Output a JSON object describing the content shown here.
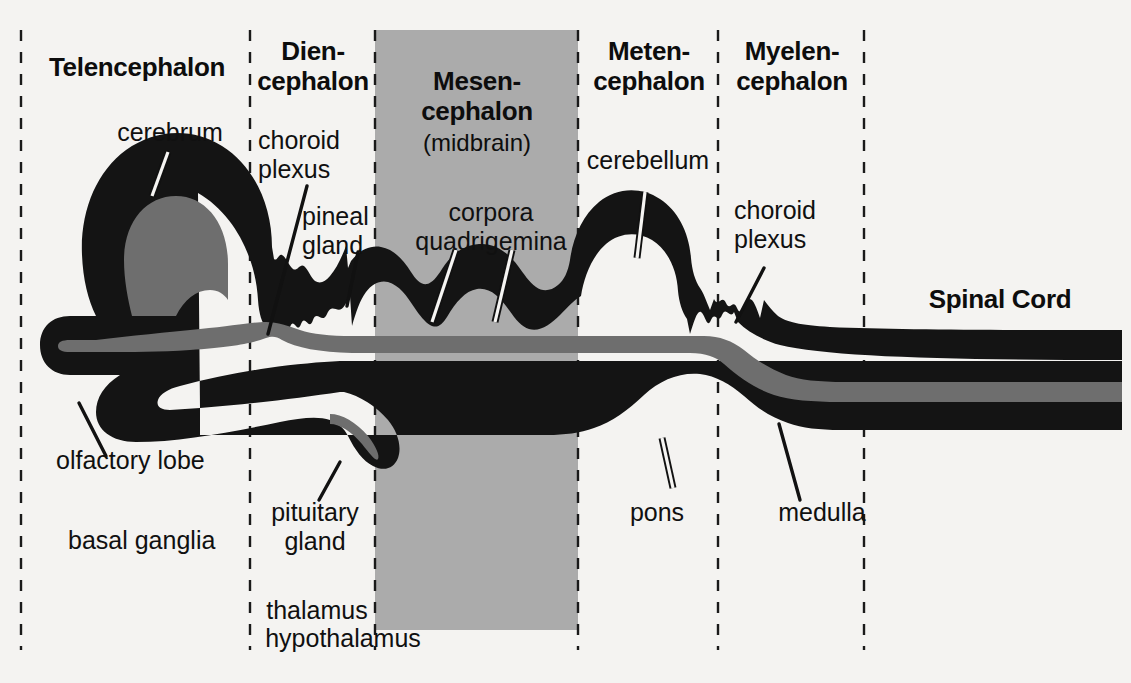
{
  "figure": {
    "kind": "anatomical-diagram",
    "background_color": "#f4f3f1",
    "tissue_color": "#141414",
    "ventricle_color": "#6e6e6e",
    "highlight_box_color": "#ababab",
    "divider_style": "dashed"
  },
  "regions": [
    {
      "id": "telencephalon",
      "title": "Telencephalon",
      "subtitle": ""
    },
    {
      "id": "diencephalon",
      "title": "Dien-\ncephalon",
      "subtitle": ""
    },
    {
      "id": "mesencephalon",
      "title": "Mesen-\ncephalon",
      "subtitle": "(midbrain)"
    },
    {
      "id": "metencephalon",
      "title": "Meten-\ncephalon",
      "subtitle": ""
    },
    {
      "id": "myelencephalon",
      "title": "Myelen-\ncephalon",
      "subtitle": ""
    },
    {
      "id": "spinalcord",
      "title": "Spinal Cord",
      "subtitle": ""
    }
  ],
  "labels": {
    "cerebrum": "cerebrum",
    "choroid_plexus_1": "choroid\nplexus",
    "pineal_gland": "pineal\ngland",
    "corpora_quadrigemina": "corpora\nquadrigemina",
    "cerebellum": "cerebellum",
    "choroid_plexus_2": "choroid\nplexus",
    "olfactory_lobe": "olfactory lobe",
    "basal_ganglia": "basal ganglia",
    "pituitary_gland": "pituitary\ngland",
    "thalamus": "thalamus",
    "hypothalamus": "hypothalamus",
    "pons": "pons",
    "medulla": "medulla"
  },
  "dividers_x": [
    21,
    250,
    375,
    578,
    718,
    864
  ],
  "highlight_box": {
    "x": 375,
    "y": 30,
    "width": 203,
    "height": 600
  }
}
